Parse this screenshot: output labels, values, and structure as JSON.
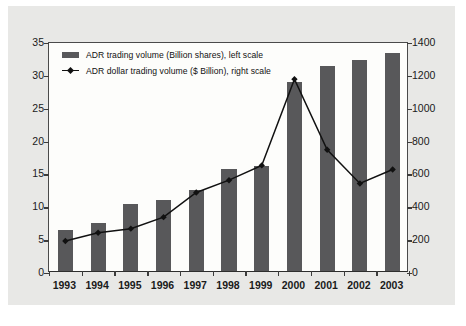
{
  "chart_data": {
    "type": "bar",
    "title": "",
    "xlabel": "",
    "ylabel": "",
    "grid": false,
    "legend_position": "top-left",
    "categories": [
      "1993",
      "1994",
      "1995",
      "1996",
      "1997",
      "1998",
      "1999",
      "2000",
      "2001",
      "2002",
      "2003"
    ],
    "series": [
      {
        "name": "ADR trading volume (Billion shares), left scale",
        "type": "bar",
        "axis": "left",
        "color": "#58585a",
        "values": [
          6.3,
          7.3,
          10.2,
          10.8,
          12.4,
          15.5,
          16.0,
          28.8,
          31.2,
          32.1,
          33.2
        ]
      },
      {
        "name": "ADR dollar trading volume ($ Billion), right scale",
        "type": "line",
        "axis": "right",
        "color": "#111111",
        "marker": "diamond",
        "values": [
          195,
          245,
          270,
          340,
          490,
          565,
          655,
          1180,
          750,
          545,
          630
        ]
      }
    ],
    "left_axis": {
      "ylim": [
        0,
        35
      ],
      "ticks": [
        0,
        5,
        10,
        15,
        20,
        25,
        30,
        35
      ],
      "tick_labels": [
        "0",
        "5",
        "10",
        "15",
        "20",
        "25",
        "30",
        "35"
      ]
    },
    "right_axis": {
      "ylim": [
        0,
        1400
      ],
      "ticks": [
        0,
        200,
        400,
        600,
        800,
        1000,
        1200,
        1400
      ],
      "tick_labels": [
        "0",
        "200",
        "400",
        "600",
        "800",
        "1000",
        "1200",
        "1400"
      ]
    }
  },
  "legend": {
    "items": [
      {
        "label": "ADR trading volume (Billion shares), left scale",
        "marker": "bar-swatch"
      },
      {
        "label": "ADR dollar trading volume ($ Billion), right scale",
        "marker": "line-diamond"
      }
    ]
  },
  "colors": {
    "bar": "#58585a",
    "line": "#111111",
    "panel_background": "#fdfdfb",
    "mat_background": "#e8e8e6",
    "axis": "#3c3c3c"
  }
}
